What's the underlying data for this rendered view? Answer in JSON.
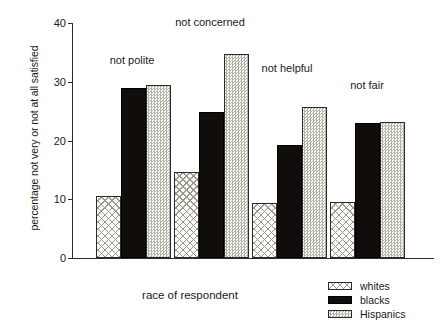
{
  "chart_data": {
    "type": "bar",
    "title": "",
    "subtitle": "",
    "xlabel": "race of respondent",
    "ylabel": "percentage not very or not at all satisfied",
    "categories": [
      "not polite",
      "not concerned",
      "not helpful",
      "not fair"
    ],
    "series": [
      {
        "name": "whites",
        "values": [
          10.5,
          14.7,
          9.3,
          9.5
        ]
      },
      {
        "name": "blacks",
        "values": [
          28.9,
          24.9,
          19.3,
          22.9
        ]
      },
      {
        "name": "Hispanics",
        "values": [
          29.4,
          34.7,
          25.7,
          23.2
        ]
      }
    ],
    "ylim": [
      0,
      40
    ],
    "yticks": [
      "0",
      "10",
      "20",
      "30",
      "40"
    ],
    "ytick_values": [
      0,
      10,
      20,
      30,
      40
    ],
    "grid": false,
    "legend_position": "bottom-right",
    "legend_entries": [
      "whites",
      "blacks",
      "Hispanics"
    ],
    "category_label_position": "inside-plot-above-group",
    "colors": {
      "whites": "#fbfbf8",
      "blacks": "#100d0a",
      "hispanics": "#f7f7f4",
      "axis": "#2b2b2b",
      "text": "#1a1a1a",
      "background": "#ffffff"
    }
  }
}
